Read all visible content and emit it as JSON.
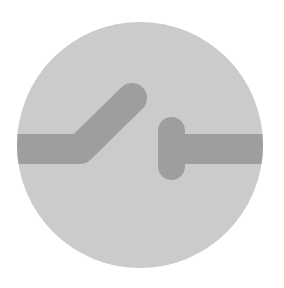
{
  "icon": {
    "name": "open-switch-icon",
    "description": "Open electrical switch symbol",
    "colors": {
      "background": "#ffffff",
      "circle": "#cbcbcb",
      "conductor": "#9e9e9e"
    }
  }
}
